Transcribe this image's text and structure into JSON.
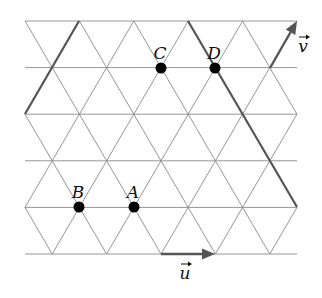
{
  "figure": {
    "grid": {
      "type": "triangular-lattice",
      "origin": [
        25,
        21
      ],
      "side": 54.4,
      "row_height": 46.6,
      "rows": 6,
      "x_min": 25,
      "x_max": 297,
      "line_color": "#8a8a8a"
    },
    "points": [
      {
        "label": "A",
        "x": 134,
        "y": 207
      },
      {
        "label": "B",
        "x": 79,
        "y": 207
      },
      {
        "label": "C",
        "x": 161,
        "y": 68
      },
      {
        "label": "D",
        "x": 215,
        "y": 68
      }
    ],
    "thick_lines": [
      {
        "x1": 79,
        "y1": 21,
        "x2": 25,
        "y2": 114
      },
      {
        "x1": 188,
        "y1": 21,
        "x2": 297,
        "y2": 207
      }
    ],
    "vectors": [
      {
        "name": "u",
        "label": "u",
        "x1": 161,
        "y1": 254,
        "x2": 215,
        "y2": 254,
        "label_x": 185,
        "label_y": 279
      },
      {
        "name": "v",
        "label": "v",
        "x1": 270,
        "y1": 68,
        "x2": 297,
        "y2": 21,
        "label_x": 303,
        "label_y": 52
      }
    ],
    "accent_color": "#555555"
  }
}
